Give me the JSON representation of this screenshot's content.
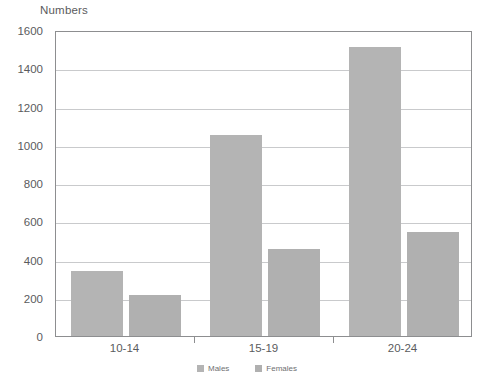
{
  "chart_data": {
    "type": "bar",
    "title": "Numbers",
    "xlabel": "",
    "ylabel": "Numbers",
    "categories": [
      "10-14",
      "15-19",
      "20-24"
    ],
    "series": [
      {
        "name": "Males",
        "values": [
          340,
          1050,
          1510
        ],
        "color": "#b4b4b4"
      },
      {
        "name": "Females",
        "values": [
          215,
          455,
          545
        ],
        "color": "#b0b0b0"
      }
    ],
    "ylim": [
      0,
      1600
    ],
    "yticks": [
      0,
      200,
      400,
      600,
      800,
      1000,
      1200,
      1400,
      1600
    ],
    "ytick_labels": [
      "0",
      "200",
      "400",
      "600",
      "800",
      "1000",
      "1200",
      "1400",
      "1600"
    ],
    "grid": true,
    "legend_position": "bottom"
  },
  "legend": {
    "items": [
      {
        "label": "Males",
        "swatch_color": "#b4b4b4"
      },
      {
        "label": "Females",
        "swatch_color": "#b0b0b0"
      }
    ]
  },
  "colors": {
    "bar_males": "#b4b4b4",
    "bar_females": "#b0b0b0",
    "gridline": "#c9cacc",
    "axis": "#8d8e90",
    "text": "#5a5b5d",
    "background": "#ffffff"
  }
}
